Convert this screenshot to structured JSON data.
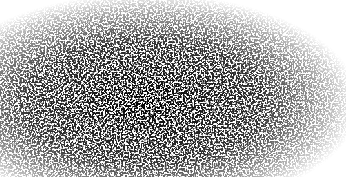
{
  "image": {
    "description": "Grayscale speckle / stipple noise texture, densest left-center, fading to white at right and edges",
    "width": 346,
    "height": 177,
    "colors": {
      "background": "#ffffff",
      "speckle": "#1a1a1a"
    },
    "density_center": {
      "x": 0.42,
      "y": 0.55
    }
  }
}
